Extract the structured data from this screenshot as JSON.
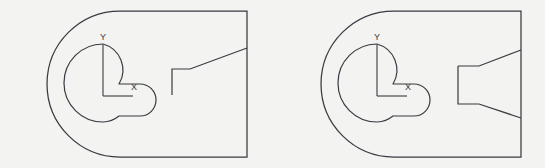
{
  "page": {
    "background_color": "#f3f3f1",
    "line_color": "#3a3a42",
    "width": 545,
    "height": 168
  },
  "figures": [
    {
      "id": "figure-left",
      "name": "left-drawing",
      "outline_shape": "d-plate-rounded-left-cap",
      "axis_labels": {
        "x": "X",
        "y": "Y"
      },
      "features": [
        "keyhole-cutout",
        "coordinate-axis-cross",
        "step-notch-with-single-diagonal"
      ],
      "outline_path": "M 196 11 L 247 11 L 247 157 L 196 157 L 120 157 A 73 73 0 0 1 120 11 Z",
      "keyhole_path": "M 103 44 A 27 27 0 1 0 103 122 A 27 27 0 0 0 119 116 L 140 116 A 16 16 0 0 0 140 84 L 119 84 A 27 27 0 0 0 103 44 Z",
      "axis_vertical": "M 103 45 L 103 96",
      "axis_horizontal": "M 103 96 L 133 96",
      "label_y_pos": {
        "x": 103,
        "y": 38
      },
      "label_x_pos": {
        "x": 134,
        "y": 88
      },
      "detail_path": "M 172 95 L 172 69 L 190 69 L 247 48"
    },
    {
      "id": "figure-right",
      "name": "right-drawing",
      "outline_shape": "d-plate-rounded-left-cap",
      "axis_labels": {
        "x": "X",
        "y": "Y"
      },
      "features": [
        "keyhole-cutout",
        "coordinate-axis-cross",
        "symmetric-tapered-funnel"
      ],
      "outline_path": "M 470 11 L 521 11 L 521 157 L 470 157 L 394 157 A 73 73 0 0 1 394 11 Z",
      "keyhole_path": "M 377 44 A 27 27 0 1 0 377 122 A 27 27 0 0 0 393 116 L 414 116 A 16 16 0 0 0 414 84 L 393 84 A 27 27 0 0 0 377 44 Z",
      "axis_vertical": "M 377 45 L 377 96",
      "axis_horizontal": "M 377 96 L 407 96",
      "label_y_pos": {
        "x": 377,
        "y": 38
      },
      "label_x_pos": {
        "x": 408,
        "y": 88
      },
      "funnel_path": "M 458 66 L 458 104 L 479 104 L 521 118 M 458 66 L 479 66 L 521 50"
    }
  ]
}
